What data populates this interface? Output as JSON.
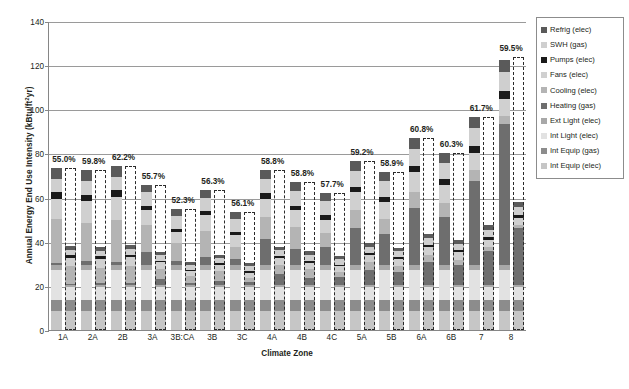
{
  "chart_data": {
    "type": "bar",
    "title": "",
    "xlabel": "Climate Zone",
    "ylabel": "Annual Energy End Use Intensity (kBtu/ft²yr)",
    "ylim": [
      0,
      140
    ],
    "yticks": [
      0,
      20,
      40,
      60,
      80,
      100,
      120,
      140
    ],
    "grid": true,
    "legend_position": "right",
    "stacked": true,
    "categories": [
      "1A",
      "2A",
      "2B",
      "3A",
      "3B:CA",
      "3B",
      "3C",
      "4A",
      "4B",
      "4C",
      "5A",
      "5B",
      "6A",
      "6B",
      "7",
      "8"
    ],
    "series": [
      {
        "name": "Int Equip (elec)",
        "color": "#c6c6c6",
        "values": [
          8.8,
          8.8,
          8.8,
          8.8,
          8.8,
          8.8,
          8.8,
          8.8,
          8.8,
          8.8,
          8.8,
          8.8,
          8.8,
          8.8,
          8.8,
          8.8
        ],
        "values_proposed": [
          8.8,
          8.8,
          8.8,
          8.8,
          8.8,
          8.8,
          8.8,
          8.8,
          8.8,
          8.8,
          8.8,
          8.8,
          8.8,
          8.8,
          8.8,
          8.8
        ]
      },
      {
        "name": "Int Equip (gas)",
        "color": "#8c8c8c",
        "values": [
          4.8,
          4.8,
          4.8,
          4.8,
          4.8,
          4.8,
          4.8,
          4.8,
          4.8,
          4.8,
          4.8,
          4.8,
          4.8,
          4.8,
          4.8,
          4.8
        ],
        "values_proposed": [
          4.8,
          4.8,
          4.8,
          4.8,
          4.8,
          4.8,
          4.8,
          4.8,
          4.8,
          4.8,
          4.8,
          4.8,
          4.8,
          4.8,
          4.8,
          4.8
        ]
      },
      {
        "name": "Int Light (elec)",
        "color": "#e2e2e2",
        "values": [
          13.6,
          13.6,
          13.6,
          13.6,
          13.6,
          13.6,
          13.6,
          13.6,
          13.6,
          13.6,
          13.6,
          13.6,
          13.6,
          13.6,
          13.6,
          13.6
        ],
        "values_proposed": [
          6.0,
          6.0,
          6.0,
          6.0,
          6.0,
          6.0,
          6.0,
          6.0,
          6.0,
          6.0,
          6.0,
          6.0,
          6.0,
          6.0,
          6.0,
          6.0
        ]
      },
      {
        "name": "Ext Light (elec)",
        "color": "#a8a8a8",
        "values": [
          2.2,
          2.2,
          2.2,
          2.2,
          2.2,
          2.2,
          2.2,
          2.2,
          2.2,
          2.2,
          2.2,
          2.2,
          2.2,
          2.2,
          2.2,
          2.2
        ],
        "values_proposed": [
          1.0,
          1.0,
          1.0,
          1.0,
          1.0,
          1.0,
          1.0,
          1.0,
          1.0,
          1.0,
          1.0,
          1.0,
          1.0,
          1.0,
          1.0,
          1.0
        ]
      },
      {
        "name": "Heating (gas)",
        "color": "#6e6e6e",
        "values": [
          1.0,
          2.0,
          1.5,
          6.0,
          2.0,
          3.5,
          3.0,
          12.0,
          7.5,
          8.0,
          17.0,
          14.0,
          26.0,
          22.0,
          38.0,
          64.0
        ],
        "values_proposed": [
          0.4,
          0.8,
          0.6,
          2.4,
          0.8,
          1.4,
          1.2,
          4.8,
          3.0,
          3.2,
          6.8,
          5.6,
          10.4,
          8.8,
          15.2,
          25.6
        ]
      },
      {
        "name": "Cooling (elec)",
        "color": "#b4b4b4",
        "values": [
          20.0,
          17.0,
          19.0,
          12.0,
          8.0,
          12.0,
          5.0,
          10.0,
          10.0,
          6.5,
          8.0,
          7.0,
          7.0,
          6.0,
          5.0,
          3.5
        ],
        "values_proposed": [
          8.0,
          6.8,
          7.6,
          4.8,
          3.2,
          4.8,
          2.0,
          4.0,
          4.0,
          2.6,
          3.2,
          2.8,
          2.8,
          2.4,
          2.0,
          1.4
        ]
      },
      {
        "name": "Fans (elec)",
        "color": "#d0d0d0",
        "values": [
          9.0,
          10.0,
          10.5,
          7.0,
          5.0,
          7.0,
          5.5,
          8.0,
          7.5,
          6.0,
          8.0,
          7.5,
          9.0,
          8.5,
          8.0,
          8.0
        ],
        "values_proposed": [
          3.6,
          4.0,
          4.2,
          2.8,
          2.0,
          2.8,
          2.2,
          3.2,
          3.0,
          2.4,
          3.2,
          3.0,
          3.6,
          3.4,
          3.2,
          3.2
        ]
      },
      {
        "name": "Pumps (elec)",
        "color": "#1a1a1a",
        "values": [
          3.0,
          3.0,
          3.0,
          2.0,
          1.5,
          2.0,
          1.5,
          2.5,
          2.0,
          2.0,
          2.5,
          2.5,
          3.0,
          2.5,
          3.0,
          3.5
        ],
        "values_proposed": [
          1.2,
          1.2,
          1.2,
          0.8,
          0.6,
          0.8,
          0.6,
          1.0,
          0.8,
          0.8,
          1.0,
          1.0,
          1.2,
          1.0,
          1.2,
          1.4
        ]
      },
      {
        "name": "SWH (gas)",
        "color": "#cfcfcf",
        "values": [
          6.0,
          6.0,
          6.0,
          6.0,
          6.0,
          6.0,
          6.0,
          6.5,
          6.5,
          6.5,
          7.0,
          7.0,
          7.5,
          7.5,
          8.0,
          8.5
        ],
        "values_proposed": [
          2.4,
          2.4,
          2.4,
          2.4,
          2.4,
          2.4,
          2.4,
          2.6,
          2.6,
          2.6,
          2.8,
          2.8,
          3.0,
          3.0,
          3.2,
          3.4
        ]
      },
      {
        "name": "Refrig (elec)",
        "color": "#5a5a5a",
        "values": [
          5.0,
          5.0,
          5.0,
          3.5,
          3.0,
          3.5,
          3.0,
          4.0,
          4.0,
          3.5,
          4.5,
          4.0,
          5.0,
          4.5,
          5.0,
          5.5
        ],
        "values_proposed": [
          2.0,
          2.0,
          2.0,
          1.4,
          1.2,
          1.4,
          1.2,
          1.6,
          1.6,
          1.4,
          1.8,
          1.6,
          2.0,
          1.8,
          2.0,
          2.2
        ]
      }
    ],
    "totals": [
      73.4,
      72.4,
      74.4,
      65.9,
      54.9,
      63.5,
      53.5,
      72.4,
      66.9,
      61.9,
      76.4,
      71.4,
      86.9,
      80.4,
      96.4,
      123.9
    ],
    "savings_labels": [
      "55.0%",
      "59.8%",
      "62.2%",
      "55.7%",
      "52.3%",
      "56.3%",
      "56.1%",
      "58.8%",
      "58.8%",
      "57.7%",
      "59.2%",
      "58.9%",
      "60.8%",
      "60.3%",
      "61.7%",
      "59.5%"
    ],
    "proposed_totals": [
      33.0,
      29.1,
      28.1,
      29.2,
      26.2,
      27.7,
      23.5,
      29.8,
      27.6,
      26.2,
      31.2,
      29.3,
      34.1,
      31.9,
      36.9,
      50.2
    ]
  },
  "legend": {
    "items": [
      {
        "label": "Refrig (elec)",
        "color": "#5a5a5a"
      },
      {
        "label": "SWH (gas)",
        "color": "#cfcfcf"
      },
      {
        "label": "Pumps (elec)",
        "color": "#1a1a1a"
      },
      {
        "label": "Fans (elec)",
        "color": "#d0d0d0"
      },
      {
        "label": "Cooling (elec)",
        "color": "#b4b4b4"
      },
      {
        "label": "Heating (gas)",
        "color": "#6e6e6e"
      },
      {
        "label": "Ext Light (elec)",
        "color": "#a8a8a8"
      },
      {
        "label": "Int Light (elec)",
        "color": "#e2e2e2"
      },
      {
        "label": "Int Equip (gas)",
        "color": "#8c8c8c"
      },
      {
        "label": "Int Equip (elec)",
        "color": "#c6c6c6"
      }
    ]
  },
  "axis": {
    "y_title_main": "Annual Energy End Use Intensity (kBtu/ft",
    "y_title_sup": "2",
    "y_title_tail": "yr)",
    "x_title": "Climate Zone"
  }
}
